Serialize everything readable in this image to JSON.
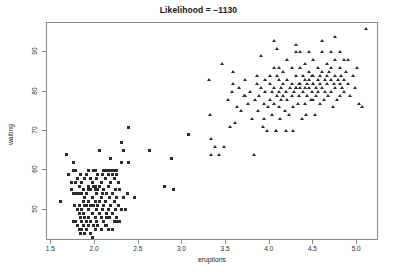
{
  "chart_data": {
    "type": "scatter",
    "title": "Likelihood = −1130",
    "xlabel": "eruptions",
    "ylabel": "waiting",
    "xlim": [
      1.45,
      5.25
    ],
    "ylim": [
      42.0,
      97.5
    ],
    "xticks": [
      1.5,
      2.0,
      2.5,
      3.0,
      3.5,
      4.0,
      4.5,
      5.0
    ],
    "xtick_labels": [
      "1.5",
      "2.0",
      "2.5",
      "3.0",
      "3.5",
      "4.0",
      "4.5",
      "5.0"
    ],
    "yticks": [
      50,
      60,
      70,
      80,
      90
    ],
    "ytick_labels": [
      "50",
      "60",
      "70",
      "80",
      "90"
    ],
    "grid": false,
    "legend": false,
    "point_color": "#2b2b2b",
    "box_color": "#8a8a8a",
    "background": "#ffffff",
    "series": [
      {
        "name": "cluster-1",
        "marker": "square",
        "points": [
          [
            1.6,
            52
          ],
          [
            1.67,
            64
          ],
          [
            1.7,
            59
          ],
          [
            1.73,
            55
          ],
          [
            1.75,
            47
          ],
          [
            1.75,
            54
          ],
          [
            1.75,
            60
          ],
          [
            1.75,
            62
          ],
          [
            1.77,
            51
          ],
          [
            1.78,
            47
          ],
          [
            1.78,
            54
          ],
          [
            1.78,
            57
          ],
          [
            1.8,
            46
          ],
          [
            1.8,
            50
          ],
          [
            1.8,
            54
          ],
          [
            1.8,
            58
          ],
          [
            1.82,
            45
          ],
          [
            1.82,
            49
          ],
          [
            1.82,
            51
          ],
          [
            1.82,
            56
          ],
          [
            1.83,
            44
          ],
          [
            1.83,
            48
          ],
          [
            1.83,
            54
          ],
          [
            1.83,
            59
          ],
          [
            1.85,
            45
          ],
          [
            1.85,
            47
          ],
          [
            1.85,
            50
          ],
          [
            1.85,
            54
          ],
          [
            1.85,
            57
          ],
          [
            1.87,
            46
          ],
          [
            1.87,
            49
          ],
          [
            1.87,
            52
          ],
          [
            1.87,
            55
          ],
          [
            1.88,
            44
          ],
          [
            1.88,
            48
          ],
          [
            1.88,
            53
          ],
          [
            1.88,
            58
          ],
          [
            1.9,
            45
          ],
          [
            1.9,
            47
          ],
          [
            1.9,
            51
          ],
          [
            1.9,
            54
          ],
          [
            1.9,
            59
          ],
          [
            1.92,
            46
          ],
          [
            1.92,
            50
          ],
          [
            1.92,
            55
          ],
          [
            1.92,
            60
          ],
          [
            1.93,
            48
          ],
          [
            1.93,
            52
          ],
          [
            1.93,
            56
          ],
          [
            1.95,
            44
          ],
          [
            1.95,
            47
          ],
          [
            1.95,
            51
          ],
          [
            1.95,
            55
          ],
          [
            1.95,
            58
          ],
          [
            1.97,
            43
          ],
          [
            1.97,
            49
          ],
          [
            1.97,
            53
          ],
          [
            1.97,
            57
          ],
          [
            1.98,
            46
          ],
          [
            1.98,
            51
          ],
          [
            1.98,
            56
          ],
          [
            1.98,
            60
          ],
          [
            2.0,
            45
          ],
          [
            2.0,
            48
          ],
          [
            2.0,
            52
          ],
          [
            2.0,
            55
          ],
          [
            2.0,
            56
          ],
          [
            2.0,
            60
          ],
          [
            2.02,
            47
          ],
          [
            2.02,
            50
          ],
          [
            2.02,
            54
          ],
          [
            2.02,
            58
          ],
          [
            2.03,
            46
          ],
          [
            2.03,
            51
          ],
          [
            2.03,
            55
          ],
          [
            2.03,
            59
          ],
          [
            2.05,
            49
          ],
          [
            2.05,
            52
          ],
          [
            2.05,
            56
          ],
          [
            2.05,
            65
          ],
          [
            2.07,
            48
          ],
          [
            2.07,
            53
          ],
          [
            2.07,
            57
          ],
          [
            2.08,
            50
          ],
          [
            2.08,
            54
          ],
          [
            2.08,
            59
          ],
          [
            2.1,
            47
          ],
          [
            2.1,
            51
          ],
          [
            2.1,
            55
          ],
          [
            2.1,
            60
          ],
          [
            2.12,
            46
          ],
          [
            2.12,
            52
          ],
          [
            2.12,
            58
          ],
          [
            2.13,
            49
          ],
          [
            2.13,
            54
          ],
          [
            2.13,
            60
          ],
          [
            2.15,
            45
          ],
          [
            2.15,
            50
          ],
          [
            2.15,
            56
          ],
          [
            2.15,
            59
          ],
          [
            2.17,
            48
          ],
          [
            2.17,
            53
          ],
          [
            2.17,
            60
          ],
          [
            2.18,
            51
          ],
          [
            2.18,
            57
          ],
          [
            2.2,
            45
          ],
          [
            2.2,
            49
          ],
          [
            2.2,
            54
          ],
          [
            2.2,
            59
          ],
          [
            2.2,
            60
          ],
          [
            2.22,
            47
          ],
          [
            2.22,
            52
          ],
          [
            2.22,
            58
          ],
          [
            2.23,
            50
          ],
          [
            2.23,
            55
          ],
          [
            2.23,
            60
          ],
          [
            2.25,
            48
          ],
          [
            2.25,
            53
          ],
          [
            2.25,
            59
          ],
          [
            2.27,
            51
          ],
          [
            2.27,
            57
          ],
          [
            2.28,
            47
          ],
          [
            2.28,
            55
          ],
          [
            2.3,
            50
          ],
          [
            2.3,
            62
          ],
          [
            2.32,
            53
          ],
          [
            2.33,
            65
          ],
          [
            2.35,
            50
          ],
          [
            2.37,
            54
          ],
          [
            2.38,
            71
          ],
          [
            2.38,
            62
          ],
          [
            2.3,
            67
          ],
          [
            2.18,
            63
          ],
          [
            2.2,
            59
          ],
          [
            2.25,
            60
          ],
          [
            2.13,
            48
          ],
          [
            2.07,
            45
          ],
          [
            1.88,
            51
          ],
          [
            1.78,
            60
          ],
          [
            1.73,
            57
          ],
          [
            2.45,
            53
          ],
          [
            2.62,
            65
          ],
          [
            2.8,
            56
          ],
          [
            2.88,
            63
          ],
          [
            2.9,
            55
          ],
          [
            3.07,
            69
          ],
          [
            1.97,
            42
          ],
          [
            2.13,
            46
          ],
          [
            2.25,
            47
          ]
        ]
      },
      {
        "name": "cluster-2",
        "marker": "triangle",
        "points": [
          [
            3.3,
            83
          ],
          [
            3.32,
            74
          ],
          [
            3.33,
            68
          ],
          [
            3.33,
            64
          ],
          [
            3.37,
            66
          ],
          [
            3.42,
            64
          ],
          [
            3.45,
            87
          ],
          [
            3.48,
            66
          ],
          [
            3.52,
            78
          ],
          [
            3.55,
            71
          ],
          [
            3.57,
            80
          ],
          [
            3.58,
            85
          ],
          [
            3.6,
            72
          ],
          [
            3.62,
            76
          ],
          [
            3.65,
            81
          ],
          [
            3.67,
            75
          ],
          [
            3.7,
            79
          ],
          [
            3.72,
            83
          ],
          [
            3.75,
            77
          ],
          [
            3.77,
            80
          ],
          [
            3.8,
            73
          ],
          [
            3.82,
            64
          ],
          [
            3.83,
            78
          ],
          [
            3.85,
            84
          ],
          [
            3.85,
            82
          ],
          [
            3.87,
            75
          ],
          [
            3.88,
            79
          ],
          [
            3.9,
            89
          ],
          [
            3.9,
            81
          ],
          [
            3.92,
            71
          ],
          [
            3.93,
            77
          ],
          [
            3.95,
            83
          ],
          [
            3.95,
            80
          ],
          [
            3.97,
            70
          ],
          [
            3.98,
            76
          ],
          [
            4.0,
            84
          ],
          [
            4.0,
            82
          ],
          [
            4.0,
            78
          ],
          [
            4.02,
            74
          ],
          [
            4.03,
            80
          ],
          [
            4.05,
            93
          ],
          [
            4.05,
            86
          ],
          [
            4.05,
            81
          ],
          [
            4.05,
            77
          ],
          [
            4.07,
            70
          ],
          [
            4.07,
            70
          ],
          [
            4.08,
            91
          ],
          [
            4.08,
            84
          ],
          [
            4.08,
            79
          ],
          [
            4.1,
            86
          ],
          [
            4.1,
            83
          ],
          [
            4.1,
            80
          ],
          [
            4.1,
            76
          ],
          [
            4.12,
            73
          ],
          [
            4.13,
            81
          ],
          [
            4.13,
            78
          ],
          [
            4.15,
            85
          ],
          [
            4.15,
            82
          ],
          [
            4.15,
            79
          ],
          [
            4.17,
            75
          ],
          [
            4.18,
            80
          ],
          [
            4.2,
            88
          ],
          [
            4.2,
            83
          ],
          [
            4.2,
            78
          ],
          [
            4.22,
            74
          ],
          [
            4.23,
            81
          ],
          [
            4.25,
            86
          ],
          [
            4.25,
            82
          ],
          [
            4.25,
            79
          ],
          [
            4.27,
            76
          ],
          [
            4.28,
            80
          ],
          [
            4.3,
            92
          ],
          [
            4.3,
            90
          ],
          [
            4.3,
            84
          ],
          [
            4.3,
            81
          ],
          [
            4.3,
            81
          ],
          [
            4.32,
            77
          ],
          [
            4.33,
            82
          ],
          [
            4.33,
            79
          ],
          [
            4.35,
            90
          ],
          [
            4.35,
            86
          ],
          [
            4.35,
            82
          ],
          [
            4.35,
            81
          ],
          [
            4.37,
            73
          ],
          [
            4.38,
            84
          ],
          [
            4.38,
            80
          ],
          [
            4.4,
            87
          ],
          [
            4.4,
            83
          ],
          [
            4.4,
            81
          ],
          [
            4.4,
            77
          ],
          [
            4.42,
            74
          ],
          [
            4.43,
            82
          ],
          [
            4.43,
            79
          ],
          [
            4.45,
            90
          ],
          [
            4.45,
            85
          ],
          [
            4.45,
            83
          ],
          [
            4.45,
            81
          ],
          [
            4.47,
            78
          ],
          [
            4.48,
            84
          ],
          [
            4.48,
            80
          ],
          [
            4.5,
            88
          ],
          [
            4.5,
            84
          ],
          [
            4.5,
            82
          ],
          [
            4.5,
            82
          ],
          [
            4.5,
            78
          ],
          [
            4.52,
            74
          ],
          [
            4.53,
            81
          ],
          [
            4.53,
            79
          ],
          [
            4.55,
            86
          ],
          [
            4.55,
            83
          ],
          [
            4.55,
            80
          ],
          [
            4.57,
            77
          ],
          [
            4.58,
            84
          ],
          [
            4.58,
            82
          ],
          [
            4.6,
            93
          ],
          [
            4.6,
            90
          ],
          [
            4.6,
            85
          ],
          [
            4.6,
            81
          ],
          [
            4.62,
            78
          ],
          [
            4.63,
            83
          ],
          [
            4.63,
            80
          ],
          [
            4.65,
            87
          ],
          [
            4.65,
            84
          ],
          [
            4.65,
            82
          ],
          [
            4.67,
            79
          ],
          [
            4.68,
            85
          ],
          [
            4.7,
            90
          ],
          [
            4.7,
            86
          ],
          [
            4.7,
            83
          ],
          [
            4.7,
            80
          ],
          [
            4.72,
            76
          ],
          [
            4.73,
            82
          ],
          [
            4.75,
            94
          ],
          [
            4.75,
            88
          ],
          [
            4.75,
            84
          ],
          [
            4.75,
            81
          ],
          [
            4.77,
            78
          ],
          [
            4.78,
            83
          ],
          [
            4.8,
            90
          ],
          [
            4.8,
            86
          ],
          [
            4.8,
            82
          ],
          [
            4.8,
            79
          ],
          [
            4.82,
            84
          ],
          [
            4.83,
            81
          ],
          [
            4.85,
            88
          ],
          [
            4.85,
            83
          ],
          [
            4.85,
            80
          ],
          [
            4.87,
            85
          ],
          [
            4.9,
            88
          ],
          [
            4.9,
            82
          ],
          [
            4.92,
            79
          ],
          [
            4.95,
            84
          ],
          [
            4.97,
            81
          ],
          [
            5.0,
            86
          ],
          [
            5.02,
            77
          ],
          [
            5.05,
            76
          ],
          [
            5.1,
            96
          ],
          [
            4.27,
            70
          ],
          [
            4.18,
            70
          ],
          [
            3.58,
            82
          ],
          [
            3.72,
            79
          ],
          [
            3.93,
            73
          ]
        ]
      }
    ]
  }
}
